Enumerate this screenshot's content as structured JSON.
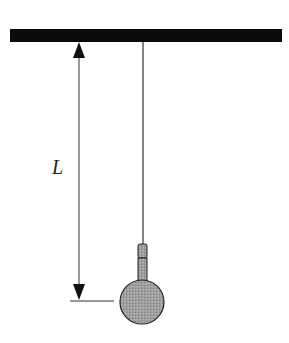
{
  "diagram": {
    "length_label": "L",
    "colors": {
      "ceiling": "#0a0a0a",
      "string": "#333333",
      "bob_fill": "#9a9a9a",
      "bob_stroke": "#222222",
      "dimension_line": "#333333"
    },
    "components": [
      "ceiling",
      "string",
      "connector",
      "bob",
      "length-dimension-arrow"
    ]
  }
}
